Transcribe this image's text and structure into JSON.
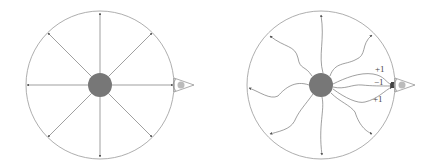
{
  "diagrams": [
    {
      "name": "straight-rays",
      "center": [
        100,
        85
      ],
      "radius": 74,
      "mass_radius": 12,
      "ray_count": 8,
      "observer": {
        "x": 175,
        "y": 85
      }
    },
    {
      "name": "wavy-rays",
      "center": [
        321,
        85
      ],
      "radius": 74,
      "mass_radius": 12,
      "ray_count": 8,
      "observer": {
        "x": 397,
        "y": 85
      },
      "labels": [
        {
          "text": "+1",
          "x": 375,
          "y": 72
        },
        {
          "text": "−1",
          "x": 374,
          "y": 85
        },
        {
          "text": "+1",
          "x": 373,
          "y": 102
        }
      ]
    }
  ],
  "colors": {
    "circle": "#999999",
    "ray": "#777777",
    "mass": "#777777",
    "eye_fill": "#bbbbbb"
  }
}
